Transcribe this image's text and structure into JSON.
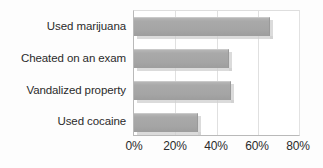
{
  "chart_data": {
    "type": "bar",
    "orientation": "horizontal",
    "title": "",
    "subtitle": "",
    "xlabel": "",
    "ylabel": "",
    "categories": [
      "Used marijuana",
      "Cheated on an exam",
      "Vandalized property",
      "Used cocaine"
    ],
    "values": [
      66,
      46,
      47,
      31
    ],
    "value_suffix": "%",
    "xlim": [
      0,
      80
    ],
    "xticks": [
      0,
      20,
      40,
      60,
      80
    ],
    "xtick_labels": [
      "0%",
      "20%",
      "40%",
      "60%",
      "80%"
    ],
    "grid": true,
    "grid_axis": "x",
    "legend": false,
    "legend_position": "none",
    "series": [
      {
        "name": "Percent of students",
        "values": [
          66,
          46,
          47,
          31
        ]
      }
    ],
    "annotations": []
  },
  "style": {
    "bar_color": "#a8a8a8",
    "bar_edge_color": "#9a9a9a",
    "shadow_color": "#cfcfcf",
    "grid_color": "#e0e0e0",
    "axis_color": "#b9b9b9",
    "text_color": "#2b2b2b",
    "background": "#ffffff"
  }
}
